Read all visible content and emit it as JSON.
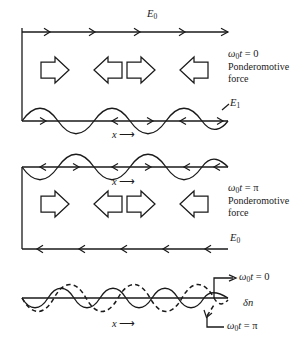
{
  "figure": {
    "stroke_color": "#1a1a1a",
    "background": "#ffffff",
    "width": 300,
    "height": 341
  },
  "panels": [
    {
      "id": "panel-top",
      "phase_label": "ω₀t = 0",
      "phase_symbol_base": "ω",
      "phase_symbol_sub": "0",
      "phase_symbol_var": "t",
      "phase_symbol_value": "= 0",
      "force_label_line1": "Ponderomotive",
      "force_label_line2": "force",
      "top_field_label": "E",
      "top_field_sub": "0",
      "top_field_direction": "right",
      "wave_field_label": "E",
      "wave_field_sub": "1",
      "axis_label": "x",
      "axis_arrow": "⟶",
      "block_arrows": [
        "right",
        "left",
        "right",
        "left"
      ],
      "field_arrow_count": 4,
      "wave_arrow_count": 4,
      "wave_phase": "crest-first"
    },
    {
      "id": "panel-middle",
      "phase_label": "ω₀t = π",
      "phase_symbol_base": "ω",
      "phase_symbol_sub": "0",
      "phase_symbol_var": "t",
      "phase_symbol_value": "= π",
      "force_label_line1": "Ponderomotive",
      "force_label_line2": "force",
      "bottom_field_label": "E",
      "bottom_field_sub": "0",
      "bottom_field_direction": "left",
      "axis_label": "x",
      "axis_arrow": "⟶",
      "block_arrows": [
        "right",
        "left",
        "right",
        "left"
      ],
      "field_arrow_count": 5,
      "wave_arrow_count": 5,
      "wave_phase": "trough-first"
    },
    {
      "id": "panel-bottom",
      "solid_curve_label": "ω₀t = 0",
      "solid_label_base": "ω",
      "solid_label_sub": "0",
      "solid_label_var": "t",
      "solid_label_value": "= 0",
      "dashed_curve_label": "ω₀t = π",
      "dashed_label_base": "ω",
      "dashed_label_sub": "0",
      "dashed_label_var": "t",
      "dashed_label_value": "= π",
      "quantity_label": "δn",
      "quantity_symbol": "δ",
      "quantity_var": "n",
      "axis_label": "x",
      "axis_arrow": "⟶"
    }
  ]
}
